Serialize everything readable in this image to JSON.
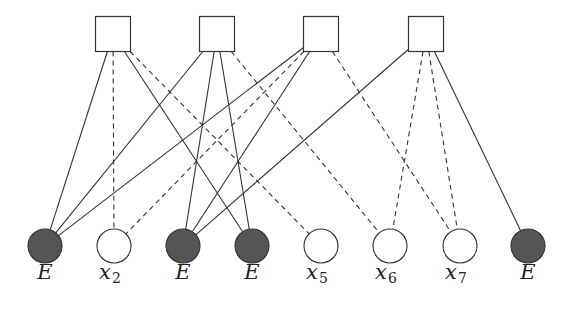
{
  "diagram": {
    "type": "bipartite-factor-graph",
    "colors": {
      "stroke": "#333333",
      "erased_fill": "#555555",
      "open_fill": "#ffffff"
    },
    "check_nodes": [
      {
        "id": "c1",
        "cx": 113,
        "cy": 34
      },
      {
        "id": "c2",
        "cx": 217,
        "cy": 34
      },
      {
        "id": "c3",
        "cx": 321,
        "cy": 34
      },
      {
        "id": "c4",
        "cx": 426,
        "cy": 34
      }
    ],
    "variable_nodes": [
      {
        "id": "v1",
        "cx": 45,
        "cy": 246,
        "erased": true,
        "label": "E",
        "sub": ""
      },
      {
        "id": "v2",
        "cx": 114,
        "cy": 246,
        "erased": false,
        "label": "x",
        "sub": "2"
      },
      {
        "id": "v3",
        "cx": 183,
        "cy": 246,
        "erased": true,
        "label": "E",
        "sub": ""
      },
      {
        "id": "v4",
        "cx": 252,
        "cy": 246,
        "erased": true,
        "label": "E",
        "sub": ""
      },
      {
        "id": "v5",
        "cx": 321,
        "cy": 246,
        "erased": false,
        "label": "x",
        "sub": "5"
      },
      {
        "id": "v6",
        "cx": 390,
        "cy": 246,
        "erased": false,
        "label": "x",
        "sub": "6"
      },
      {
        "id": "v7",
        "cx": 460,
        "cy": 246,
        "erased": false,
        "label": "x",
        "sub": "7"
      },
      {
        "id": "v8",
        "cx": 528,
        "cy": 246,
        "erased": true,
        "label": "E",
        "sub": ""
      }
    ],
    "edges": [
      {
        "from": "c1",
        "to": "v1",
        "style": "solid"
      },
      {
        "from": "c1",
        "to": "v2",
        "style": "dashed"
      },
      {
        "from": "c1",
        "to": "v4",
        "style": "solid"
      },
      {
        "from": "c1",
        "to": "v5",
        "style": "dashed"
      },
      {
        "from": "c2",
        "to": "v1",
        "style": "solid"
      },
      {
        "from": "c2",
        "to": "v3",
        "style": "solid"
      },
      {
        "from": "c2",
        "to": "v4",
        "style": "solid"
      },
      {
        "from": "c2",
        "to": "v6",
        "style": "dashed"
      },
      {
        "from": "c3",
        "to": "v1",
        "style": "solid"
      },
      {
        "from": "c3",
        "to": "v2",
        "style": "dashed"
      },
      {
        "from": "c3",
        "to": "v3",
        "style": "solid"
      },
      {
        "from": "c3",
        "to": "v7",
        "style": "dashed"
      },
      {
        "from": "c4",
        "to": "v3",
        "style": "solid"
      },
      {
        "from": "c4",
        "to": "v6",
        "style": "dashed"
      },
      {
        "from": "c4",
        "to": "v7",
        "style": "dashed"
      },
      {
        "from": "c4",
        "to": "v8",
        "style": "solid"
      }
    ],
    "labels": [
      "E",
      "x2",
      "E",
      "E",
      "x5",
      "x6",
      "x7",
      "E"
    ]
  }
}
